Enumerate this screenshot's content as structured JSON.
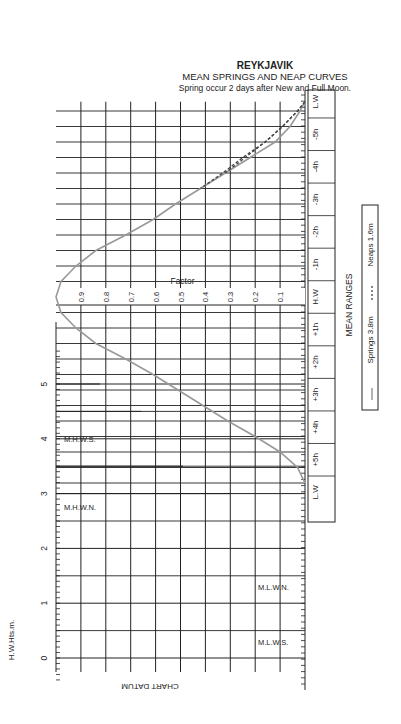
{
  "header": {
    "title": "REYKJAVIK",
    "subtitle": "MEAN SPRINGS AND NEAP CURVES",
    "note": "Spring occur 2 days after New and Full Moon."
  },
  "labels": {
    "factor": "Factor",
    "height_axis": "H.W.Hts.m.",
    "chart_datum": "CHART DATUM",
    "mean_ranges": "MEAN RANGES",
    "mhws": "M.H.W.S.",
    "mhwn": "M.H.W.N.",
    "mlwn": "M.L.W.N.",
    "mlws": "M.L.W.S."
  },
  "legend": {
    "springs": "Springs 3.8m",
    "neaps": "Neaps 1.6m"
  },
  "colors": {
    "grid": "#222222",
    "springs_curve": "#999999",
    "neaps_curve": "#444444"
  },
  "chart_data": {
    "type": "line",
    "subtitle": "Spring occur 2 days after New and Full Moon.",
    "xlabel": "Time relative to H.W. (hours)",
    "ylabel": "Factor",
    "x_ticks": [
      "L.W",
      "-5h",
      "-4h",
      "-3h",
      "-2h",
      "-1h",
      "H.W",
      "+1h",
      "+2h",
      "+3h",
      "+4h",
      "+5h",
      "L.W"
    ],
    "factor_ticks": [
      0.9,
      0.8,
      0.7,
      0.6,
      0.5,
      0.4,
      0.3,
      0.2,
      0.1
    ],
    "height_axis": {
      "label": "H.W.Hts.m.",
      "ticks": [
        0,
        1,
        2,
        3,
        4,
        5
      ],
      "range": [
        0,
        5.5
      ]
    },
    "levels": {
      "M.H.W.S.": 4.0,
      "M.H.W.N.": 2.7,
      "M.L.W.N.": 1.2,
      "M.L.W.S.": 0.2
    },
    "series": [
      {
        "name": "Springs 3.8m",
        "style": "solid",
        "x": [
          -6.3,
          -6,
          -5.5,
          -5,
          -4.5,
          -4,
          -3.5,
          -3,
          -2.5,
          -2,
          -1.5,
          -1,
          -0.5,
          0,
          0.5,
          1,
          1.5,
          2,
          2.5,
          3,
          3.5,
          4,
          4.5,
          5,
          5.5,
          6
        ],
        "values": [
          0.0,
          0.02,
          0.06,
          0.12,
          0.22,
          0.32,
          0.42,
          0.52,
          0.61,
          0.72,
          0.84,
          0.92,
          0.98,
          1.0,
          0.98,
          0.92,
          0.84,
          0.72,
          0.61,
          0.51,
          0.41,
          0.31,
          0.2,
          0.1,
          0.03,
          0.0
        ]
      },
      {
        "name": "Neaps 1.6m",
        "style": "dashed",
        "x": [
          -6.3,
          -6,
          -5.5,
          -5,
          -4.5,
          -4,
          -3.5
        ],
        "values": [
          0.0,
          0.03,
          0.09,
          0.16,
          0.25,
          0.33,
          0.42
        ]
      }
    ],
    "legend_position": "right",
    "grid": true
  }
}
